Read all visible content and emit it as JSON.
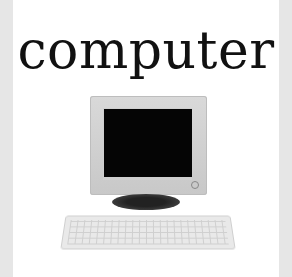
{
  "title": {
    "text": "computer"
  },
  "illustration": {
    "subject": "desktop-computer",
    "parts": [
      "crt-monitor",
      "monitor-stand",
      "keyboard"
    ],
    "colors": {
      "frame": "#e6e6e6",
      "background": "#ffffff",
      "screen": "#050505",
      "casing": "#d0d0d0"
    }
  }
}
